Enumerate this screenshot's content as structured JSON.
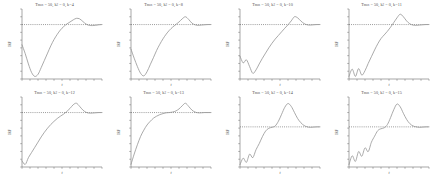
{
  "figure": {
    "layout": {
      "rows": 2,
      "cols": 4
    },
    "colors": {
      "background": "#ffffff",
      "curve": "#8e8e8e",
      "reference_line": "#4a4a4a",
      "axis": "#6b6b6b",
      "text": "#4f4f4f"
    }
  },
  "chart_data": [
    {
      "type": "line",
      "title": "T_max = 50, k_2 = 0, k=4",
      "title_parts": {
        "prefix": "T",
        "sub1": "max",
        "mid": " = 50, k",
        "sub2": "2",
        "suffix": " = 0, k=4"
      },
      "xlabel": "t",
      "ylabel": "IRF",
      "xlim": [
        0,
        50
      ],
      "ylim": [
        -1.1,
        1.6
      ],
      "grid": false,
      "legend": "none",
      "reference_line": {
        "y": 1.0,
        "style": "dotted"
      },
      "x": [
        0,
        2,
        4,
        6,
        8,
        10,
        12,
        14,
        16,
        18,
        20,
        22,
        24,
        26,
        28,
        30,
        32,
        34,
        36,
        38,
        40,
        42,
        44,
        46,
        48,
        50
      ],
      "y": [
        0.22,
        -0.12,
        -0.52,
        -0.85,
        -1.0,
        -0.92,
        -0.66,
        -0.38,
        -0.1,
        0.18,
        0.42,
        0.62,
        0.79,
        0.92,
        1.02,
        1.1,
        1.18,
        1.24,
        1.22,
        1.12,
        1.02,
        0.97,
        0.96,
        0.97,
        0.99,
        1.0
      ]
    },
    {
      "type": "line",
      "title": "T_max = 50, k_2 = 0, k=8",
      "title_parts": {
        "prefix": "T",
        "sub1": "max",
        "mid": " = 50, k",
        "sub2": "2",
        "suffix": " = 0, k=8"
      },
      "xlabel": "t",
      "ylabel": "IRF",
      "xlim": [
        0,
        50
      ],
      "ylim": [
        -1.1,
        1.6
      ],
      "grid": false,
      "legend": "none",
      "reference_line": {
        "y": 1.0,
        "style": "dotted"
      },
      "x": [
        0,
        2,
        4,
        6,
        8,
        10,
        12,
        14,
        16,
        18,
        20,
        22,
        24,
        26,
        28,
        30,
        32,
        34,
        36,
        38,
        40,
        42,
        44,
        46,
        48,
        50
      ],
      "y": [
        0.05,
        -0.3,
        -0.62,
        -0.88,
        -0.98,
        -0.82,
        -0.55,
        -0.28,
        0.0,
        0.24,
        0.45,
        0.63,
        0.78,
        0.9,
        1.0,
        1.1,
        1.22,
        1.3,
        1.2,
        1.06,
        0.99,
        0.97,
        0.98,
        0.99,
        1.0,
        1.0
      ]
    },
    {
      "type": "line",
      "title": "T_max = 50, k_2 = 0, k=10",
      "title_parts": {
        "prefix": "T",
        "sub1": "max",
        "mid": " = 50, k",
        "sub2": "2",
        "suffix": " = 0, k=10"
      },
      "xlabel": "t",
      "ylabel": "IRF",
      "xlim": [
        0,
        50
      ],
      "ylim": [
        -1.1,
        1.6
      ],
      "grid": false,
      "legend": "none",
      "reference_line": {
        "y": 1.0,
        "style": "dotted"
      },
      "x": [
        0,
        2,
        4,
        6,
        8,
        10,
        12,
        14,
        16,
        18,
        20,
        22,
        24,
        26,
        28,
        30,
        32,
        34,
        36,
        38,
        40,
        42,
        44,
        46,
        48,
        50
      ],
      "y": [
        -0.22,
        -0.48,
        -0.36,
        -0.62,
        -0.88,
        -0.75,
        -0.52,
        -0.3,
        -0.1,
        0.1,
        0.28,
        0.44,
        0.58,
        0.72,
        0.86,
        0.99,
        1.14,
        1.3,
        1.26,
        1.14,
        1.04,
        0.99,
        0.98,
        0.99,
        1.0,
        1.0
      ]
    },
    {
      "type": "line",
      "title": "T_max = 50, k_2 = 0, k=11",
      "title_parts": {
        "prefix": "T",
        "sub1": "max",
        "mid": " = 50, k",
        "sub2": "2",
        "suffix": " = 0, k=11"
      },
      "xlabel": "t",
      "ylabel": "IRF",
      "xlim": [
        0,
        50
      ],
      "ylim": [
        -1.1,
        1.6
      ],
      "grid": false,
      "legend": "none",
      "reference_line": {
        "y": 1.0,
        "style": "dotted"
      },
      "x": [
        0,
        2,
        4,
        6,
        8,
        10,
        12,
        14,
        16,
        18,
        20,
        22,
        24,
        26,
        28,
        30,
        32,
        34,
        36,
        38,
        40,
        42,
        44,
        46,
        48,
        50
      ],
      "y": [
        -1.0,
        -0.72,
        -1.0,
        -0.7,
        -0.95,
        -0.78,
        -0.5,
        -0.24,
        0.02,
        0.26,
        0.46,
        0.6,
        0.74,
        0.9,
        1.08,
        1.26,
        1.4,
        1.3,
        1.14,
        1.03,
        0.98,
        0.97,
        0.98,
        0.99,
        1.0,
        1.0
      ]
    },
    {
      "type": "line",
      "title": "T_max = 50, k_2 = 0, k=12",
      "title_parts": {
        "prefix": "T",
        "sub1": "max",
        "mid": " = 50, k",
        "sub2": "2",
        "suffix": " = 0, k=12"
      },
      "xlabel": "t",
      "ylabel": "IRF",
      "xlim": [
        0,
        50
      ],
      "ylim": [
        -1.1,
        1.6
      ],
      "grid": false,
      "legend": "none",
      "reference_line": {
        "y": 1.0,
        "style": "dotted"
      },
      "x": [
        0,
        2,
        4,
        6,
        8,
        10,
        12,
        14,
        16,
        18,
        20,
        22,
        24,
        26,
        28,
        30,
        32,
        34,
        36,
        38,
        40,
        42,
        44,
        46,
        48,
        50
      ],
      "y": [
        -0.86,
        -1.0,
        -0.74,
        -0.54,
        -0.34,
        -0.14,
        0.06,
        0.24,
        0.4,
        0.54,
        0.66,
        0.77,
        0.86,
        0.94,
        1.04,
        1.16,
        1.3,
        1.36,
        1.24,
        1.1,
        1.01,
        0.98,
        0.98,
        0.99,
        1.0,
        1.0
      ]
    },
    {
      "type": "line",
      "title": "T_max = 50, k_2 = 0, k=13",
      "title_parts": {
        "prefix": "T",
        "sub1": "max",
        "mid": " = 50, k",
        "sub2": "2",
        "suffix": " = 0, k=13"
      },
      "xlabel": "t",
      "ylabel": "IRF",
      "xlim": [
        0,
        50
      ],
      "ylim": [
        -1.1,
        1.6
      ],
      "grid": false,
      "legend": "none",
      "reference_line": {
        "y": 1.0,
        "style": "dotted"
      },
      "x": [
        0,
        2,
        4,
        6,
        8,
        10,
        12,
        14,
        16,
        18,
        20,
        22,
        24,
        26,
        28,
        30,
        32,
        34,
        36,
        38,
        40,
        42,
        44,
        46,
        48,
        50
      ],
      "y": [
        -1.0,
        -0.6,
        -0.24,
        0.08,
        0.32,
        0.52,
        0.66,
        0.78,
        0.86,
        0.92,
        0.96,
        0.99,
        1.0,
        1.02,
        1.06,
        1.14,
        1.26,
        1.36,
        1.24,
        1.1,
        1.02,
        0.99,
        0.99,
        1.0,
        1.0,
        1.0
      ]
    },
    {
      "type": "line",
      "title": "T_max = 50, k_2 = 0, k=14",
      "title_parts": {
        "prefix": "T",
        "sub1": "max",
        "mid": " = 50, k",
        "sub2": "2",
        "suffix": " = 0, k=14"
      },
      "xlabel": "t",
      "ylabel": "IRF",
      "xlim": [
        0,
        50
      ],
      "ylim": [
        -1.1,
        1.9
      ],
      "grid": false,
      "legend": "none",
      "reference_line": {
        "y": 0.62,
        "style": "dotted"
      },
      "x": [
        0,
        2,
        4,
        6,
        8,
        10,
        12,
        14,
        16,
        18,
        20,
        22,
        24,
        26,
        28,
        30,
        32,
        34,
        36,
        38,
        40,
        42,
        44,
        46,
        48,
        50
      ],
      "y": [
        -1.0,
        -0.72,
        -0.9,
        -0.55,
        -0.7,
        -0.36,
        -0.1,
        0.2,
        0.44,
        0.56,
        0.6,
        0.66,
        0.86,
        1.16,
        1.46,
        1.62,
        1.5,
        1.24,
        0.98,
        0.8,
        0.68,
        0.62,
        0.6,
        0.61,
        0.62,
        0.62
      ]
    },
    {
      "type": "line",
      "title": "T_max = 50, k_2 = 0, k=15",
      "title_parts": {
        "prefix": "T",
        "sub1": "max",
        "mid": " = 50, k",
        "sub2": "2",
        "suffix": " = 0, k=15"
      },
      "xlabel": "t",
      "ylabel": "IRF",
      "xlim": [
        0,
        50
      ],
      "ylim": [
        -1.1,
        1.9
      ],
      "grid": false,
      "legend": "none",
      "reference_line": {
        "y": 0.62,
        "style": "dotted"
      },
      "x": [
        0,
        2,
        4,
        6,
        8,
        10,
        12,
        14,
        16,
        18,
        20,
        22,
        24,
        26,
        28,
        30,
        32,
        34,
        36,
        38,
        40,
        42,
        44,
        46,
        48,
        50
      ],
      "y": [
        -1.0,
        -0.62,
        -0.86,
        -0.44,
        -0.64,
        -0.28,
        -0.44,
        -0.04,
        0.22,
        0.46,
        0.54,
        0.58,
        0.72,
        1.02,
        1.36,
        1.6,
        1.48,
        1.2,
        0.94,
        0.76,
        0.66,
        0.62,
        0.6,
        0.61,
        0.62,
        0.62
      ]
    }
  ]
}
